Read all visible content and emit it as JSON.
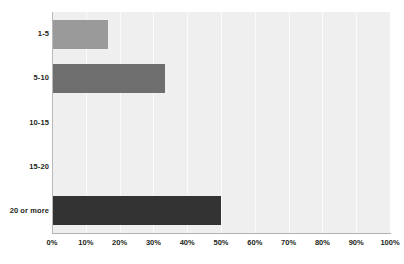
{
  "chart_data": {
    "type": "bar",
    "orientation": "horizontal",
    "title": "",
    "subtitle": "",
    "xlabel": "",
    "ylabel": "",
    "categories": [
      "1-5",
      "5-10",
      "10-15",
      "15-20",
      "20 or more"
    ],
    "values": [
      16.7,
      33.3,
      0,
      0,
      50
    ],
    "value_unit": "%",
    "xlim": [
      0,
      100
    ],
    "xticks": [
      0,
      10,
      20,
      30,
      40,
      50,
      60,
      70,
      80,
      90,
      100
    ],
    "xtick_labels": [
      "0%",
      "10%",
      "20%",
      "30%",
      "40%",
      "50%",
      "60%",
      "70%",
      "80%",
      "90%",
      "100%"
    ],
    "grid": "vertical",
    "legend": "none",
    "bar_colors": [
      "#9a9a9a",
      "#6e6e6e",
      "#555555",
      "#444444",
      "#333333"
    ],
    "plot_background": "#efefef",
    "gridline_color": "#fbfbfb",
    "axis_color": "#b2b2b2",
    "text_color": "#231f20"
  }
}
